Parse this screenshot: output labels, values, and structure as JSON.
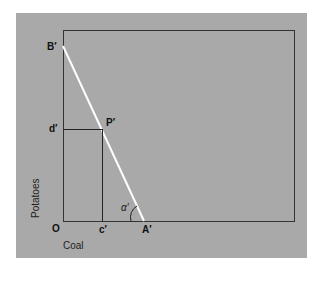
{
  "diagram": {
    "points": {
      "B": "B′",
      "P": "P′",
      "d": "d′",
      "c": "c′",
      "A": "A′",
      "O": "O",
      "alpha": "α′"
    },
    "axes": {
      "y_label": "Potatoes",
      "x_label": "Coal"
    },
    "colors": {
      "background": "#a9a9a9",
      "frame": "#333333",
      "budget_line": "#ffffff"
    }
  }
}
